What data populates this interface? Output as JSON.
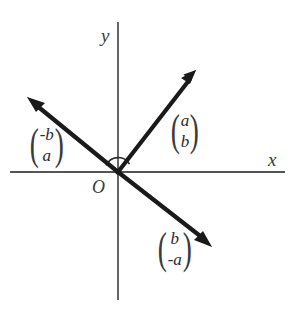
{
  "figure": {
    "background_color": "#ffffff",
    "axis_color": "#555555",
    "vector_color": "#1a1a1a",
    "width": 296,
    "height": 312
  },
  "axes": {
    "x_label": "x",
    "y_label": "y",
    "origin_label": "O",
    "origin": {
      "x": 118,
      "y": 172
    },
    "x_axis": {
      "x1": 10,
      "y1": 172,
      "x2": 285,
      "y2": 172
    },
    "y_axis": {
      "x1": 118,
      "y1": 22,
      "x2": 118,
      "y2": 300
    }
  },
  "angle_arc": {
    "name": "angle-arc-at-origin",
    "radius": 13,
    "description": "semicircular arc above the origin between the two upward vectors"
  },
  "vectors": [
    {
      "name": "vector-a-b",
      "label_top": "a",
      "label_bottom": "b",
      "direction": "upper-right",
      "tip": {
        "x": 196,
        "y": 70
      },
      "label_position": {
        "x": 168,
        "y": 110
      }
    },
    {
      "name": "vector-neg-b-a",
      "label_top": "-b",
      "label_bottom": "a",
      "direction": "upper-left",
      "tip": {
        "x": 27,
        "y": 97
      },
      "label_position": {
        "x": 27,
        "y": 124
      }
    },
    {
      "name": "vector-b-neg-a",
      "label_top": "b",
      "label_bottom": "-a",
      "direction": "lower-right",
      "tip": {
        "x": 212,
        "y": 247
      },
      "label_position": {
        "x": 155,
        "y": 228
      }
    }
  ]
}
